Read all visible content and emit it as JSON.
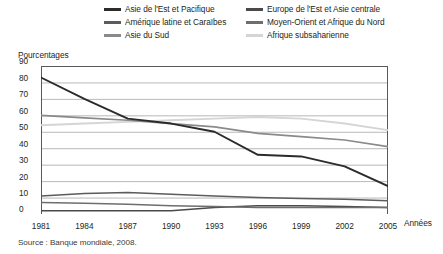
{
  "legend": {
    "items": [
      {
        "label": "Asie de l'Est et Pacifique",
        "color": "#2b2b2b",
        "column": "left"
      },
      {
        "label": "Europe de l'Est et Asie centrale",
        "color": "#4a4a4a",
        "column": "right"
      },
      {
        "label": "Amérique latine et Caraïbes",
        "color": "#5c5c5c",
        "column": "left"
      },
      {
        "label": "Moyen-Orient et Afrique du Nord",
        "color": "#6e6e6e",
        "column": "right"
      },
      {
        "label": "Asie du Sud",
        "color": "#8a8a8a",
        "column": "left"
      },
      {
        "label": "Afrique subsaharienne",
        "color": "#d5d5d5",
        "column": "right"
      }
    ]
  },
  "axes": {
    "y_title": "Pourcentages",
    "x_title": "Années",
    "y_ticks": [
      "90",
      "80",
      "70",
      "60",
      "50",
      "40",
      "30",
      "20",
      "10",
      "0"
    ],
    "x_ticks": [
      "1981",
      "1984",
      "1987",
      "1990",
      "1993",
      "1996",
      "1999",
      "2002",
      "2005"
    ]
  },
  "source": "Source : Banque mondiale, 2008.",
  "chart_data": {
    "type": "line",
    "title": "",
    "xlabel": "Années",
    "ylabel": "Pourcentages",
    "xlim": [
      1981,
      2005
    ],
    "ylim": [
      0,
      90
    ],
    "ytick_step": 10,
    "grid": true,
    "legend_position": "top",
    "x": [
      1981,
      1984,
      1987,
      1990,
      1993,
      1996,
      1999,
      2002,
      2005
    ],
    "series": [
      {
        "name": "Asie de l'Est et Pacifique",
        "color": "#2b2b2b",
        "width": 1.9,
        "values": [
          83,
          70,
          58,
          55,
          50,
          36,
          35,
          29,
          17
        ]
      },
      {
        "name": "Europe de l'Est et Asie centrale",
        "color": "#4a4a4a",
        "width": 1.5,
        "values": [
          2,
          2,
          2,
          2,
          4,
          5,
          5,
          4.5,
          4
        ]
      },
      {
        "name": "Amérique latine et Caraïbes",
        "color": "#5c5c5c",
        "width": 1.5,
        "values": [
          11,
          12.5,
          13,
          12,
          11,
          10,
          9.5,
          9,
          8
        ]
      },
      {
        "name": "Moyen-Orient et Afrique du Nord",
        "color": "#6e6e6e",
        "width": 1.5,
        "values": [
          7,
          6.5,
          6,
          5,
          4.5,
          4,
          4,
          4,
          4
        ]
      },
      {
        "name": "Asie du Sud",
        "color": "#8a8a8a",
        "width": 1.7,
        "values": [
          60,
          58.5,
          57,
          55,
          53,
          49,
          47,
          45,
          41
        ]
      },
      {
        "name": "Afrique subsaharienne",
        "color": "#d5d5d5",
        "width": 1.9,
        "values": [
          54,
          55,
          56,
          57,
          58,
          59,
          58,
          55,
          51
        ]
      }
    ]
  }
}
